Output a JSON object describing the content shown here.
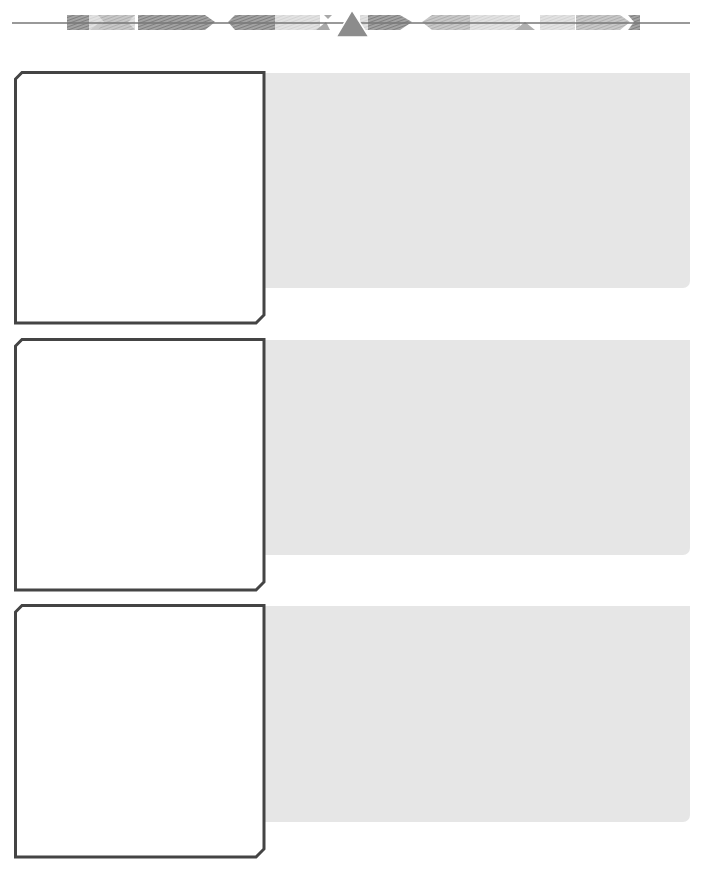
{
  "page": {
    "type": "worksheet-template",
    "width": 707,
    "height": 869
  },
  "colors": {
    "background": "#ffffff",
    "box_border": "#444444",
    "panel_fill": "#e6e6e6",
    "banner_dark": "#8a8a8a",
    "banner_mid": "#b5b5b5",
    "banner_light": "#d9d9d9",
    "banner_line": "#777777",
    "triangle": "#8c8c8c"
  },
  "header": {
    "decoration": "ornamental-banner",
    "center_icon": "triangle-icon"
  },
  "rows": [
    {
      "index": 1,
      "box_text": "",
      "panel_text": ""
    },
    {
      "index": 2,
      "box_text": "",
      "panel_text": ""
    },
    {
      "index": 3,
      "box_text": "",
      "panel_text": ""
    }
  ]
}
